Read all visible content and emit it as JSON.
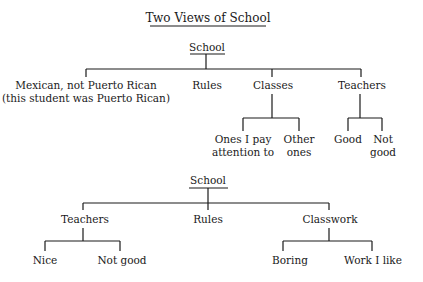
{
  "title": "Two Views of School",
  "view1": {
    "root": "School",
    "children": [
      {
        "label_line1": "Mexican, not Puerto Rican",
        "label_line2": "(this student was Puerto Rican)"
      },
      {
        "label": "Rules"
      },
      {
        "label": "Classes",
        "children": [
          {
            "line1": "Ones I pay",
            "line2": "attention to"
          },
          {
            "line1": "Other",
            "line2": "ones"
          }
        ]
      },
      {
        "label": "Teachers",
        "children": [
          {
            "line1": "Good",
            "line2": ""
          },
          {
            "line1": "Not",
            "line2": "good"
          }
        ]
      }
    ]
  },
  "view2": {
    "root": "School",
    "children": [
      {
        "label": "Teachers",
        "children": [
          {
            "label": "Nice"
          },
          {
            "label": "Not good"
          }
        ]
      },
      {
        "label": "Rules"
      },
      {
        "label": "Classwork",
        "children": [
          {
            "label": "Boring"
          },
          {
            "label": "Work I like"
          }
        ]
      }
    ]
  },
  "colors": {
    "ink": "#1a1a1a",
    "background": "#ffffff"
  }
}
